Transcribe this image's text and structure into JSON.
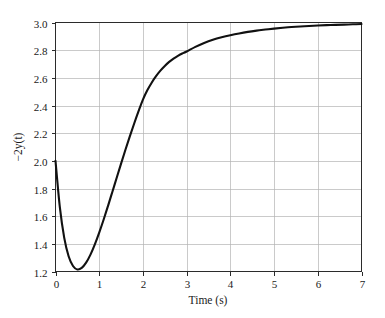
{
  "chart_data": {
    "type": "line",
    "title": "",
    "xlabel": "Time (s)",
    "ylabel": "−2y(t)",
    "xlim": [
      0,
      7
    ],
    "ylim": [
      1.2,
      3.0
    ],
    "grid": true,
    "legend": null,
    "xticks": [
      "0",
      "1",
      "2",
      "3",
      "4",
      "5",
      "6",
      "7"
    ],
    "xtick_values": [
      0,
      1,
      2,
      3,
      4,
      5,
      6,
      7
    ],
    "yticks": [
      "1.2",
      "1.4",
      "1.6",
      "1.8",
      "2.0",
      "2.2",
      "2.4",
      "2.6",
      "2.8",
      "3.0"
    ],
    "ytick_values": [
      1.2,
      1.4,
      1.6,
      1.8,
      2.0,
      2.2,
      2.4,
      2.6,
      2.8,
      3.0
    ],
    "series": [
      {
        "name": "-2y(t)",
        "color": "#111111",
        "x": [
          0.0,
          0.1,
          0.2,
          0.3,
          0.4,
          0.5,
          0.6,
          0.7,
          0.8,
          0.9,
          1.0,
          1.1,
          1.2,
          1.3,
          1.4,
          1.5,
          1.6,
          1.7,
          1.8,
          1.9,
          2.0,
          2.1,
          2.2,
          2.3,
          2.4,
          2.5,
          2.6,
          2.7,
          2.8,
          2.9,
          3.0,
          3.2,
          3.4,
          3.6,
          3.8,
          4.0,
          4.2,
          4.4,
          4.6,
          4.8,
          5.0,
          5.2,
          5.4,
          5.6,
          5.8,
          6.0,
          6.2,
          6.4,
          6.6,
          6.8,
          7.0
        ],
        "y": [
          2.0,
          1.663,
          1.443,
          1.31,
          1.24,
          1.215,
          1.226,
          1.264,
          1.322,
          1.396,
          1.481,
          1.574,
          1.673,
          1.775,
          1.878,
          1.98,
          2.08,
          2.177,
          2.27,
          2.359,
          2.443,
          2.51,
          2.565,
          2.612,
          2.652,
          2.686,
          2.715,
          2.739,
          2.759,
          2.776,
          2.79,
          2.824,
          2.852,
          2.875,
          2.893,
          2.908,
          2.921,
          2.932,
          2.941,
          2.949,
          2.956,
          2.962,
          2.967,
          2.971,
          2.975,
          2.978,
          2.981,
          2.983,
          2.985,
          2.987,
          2.989
        ],
        "annotations": {
          "start_value": 2.0,
          "minimum_x": 0.5,
          "minimum_y": 1.21,
          "asymptote": 3.0
        }
      }
    ]
  },
  "axes": {
    "xlabel_text": "Time (s)",
    "ylabel_text": "−2y(t)"
  }
}
